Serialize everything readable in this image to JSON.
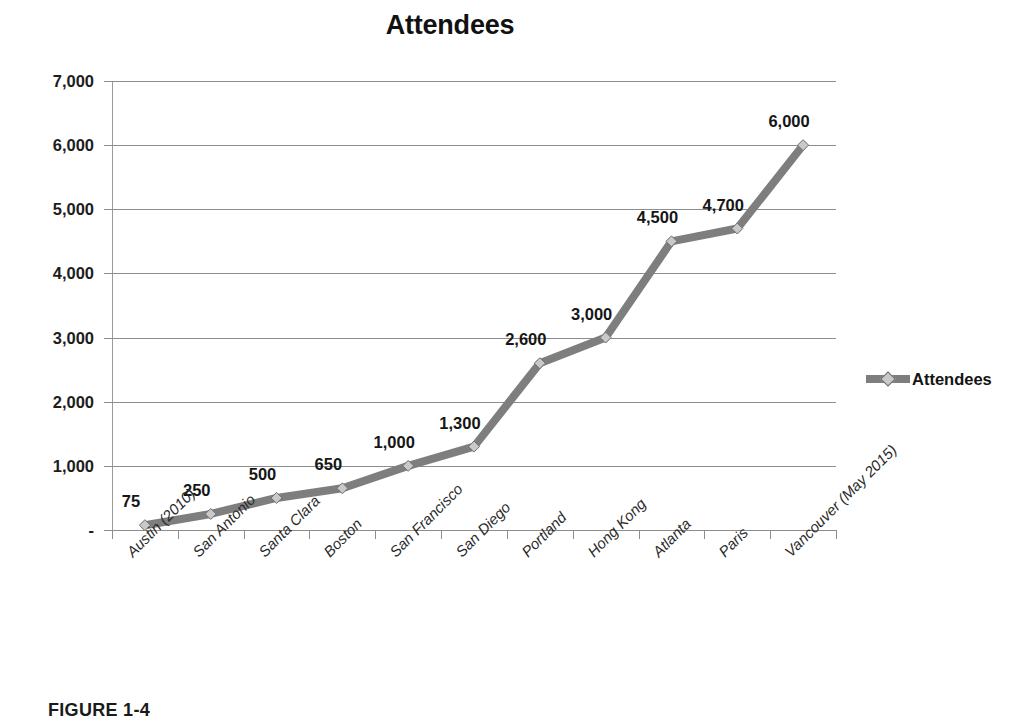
{
  "figure": {
    "caption": "FIGURE 1-4"
  },
  "chart_data": {
    "type": "line",
    "title": "Attendees",
    "xlabel": "",
    "ylabel": "",
    "categories": [
      "Austin (2010)",
      "San Antonio",
      "Santa Clara",
      "Boston",
      "San Francisco",
      "San Diego",
      "Portland",
      "Hong Kong",
      "Atlanta",
      "Paris",
      "Vancouver (May 2015)"
    ],
    "values": [
      75,
      250,
      500,
      650,
      1000,
      1300,
      2600,
      3000,
      4500,
      4700,
      6000
    ],
    "point_labels": [
      "75",
      "250",
      "500",
      "650",
      "1,000",
      "1,300",
      "2,600",
      "3,000",
      "4,500",
      "4,700",
      "6,000"
    ],
    "series": [
      {
        "name": "Attendees",
        "values": [
          75,
          250,
          500,
          650,
          1000,
          1300,
          2600,
          3000,
          4500,
          4700,
          6000
        ],
        "color": "#7e7e7e",
        "marker": "diamond"
      }
    ],
    "ylim": [
      0,
      7000
    ],
    "ytick_values": [
      0,
      1000,
      2000,
      3000,
      4000,
      5000,
      6000,
      7000
    ],
    "ytick_labels": [
      "-",
      "1,000",
      "2,000",
      "3,000",
      "4,000",
      "5,000",
      "6,000",
      "7,000"
    ],
    "grid": true,
    "grid_axis": "y",
    "legend_position": "right",
    "legend_entries": [
      "Attendees"
    ],
    "data_labels_shown": true,
    "colors": {
      "line": "#7e7e7e",
      "marker_fill": "#c9c9c9",
      "grid": "#8d8d8d",
      "axis": "#9a9a9a",
      "text": "#1a1a1a",
      "background": "#ffffff"
    }
  }
}
